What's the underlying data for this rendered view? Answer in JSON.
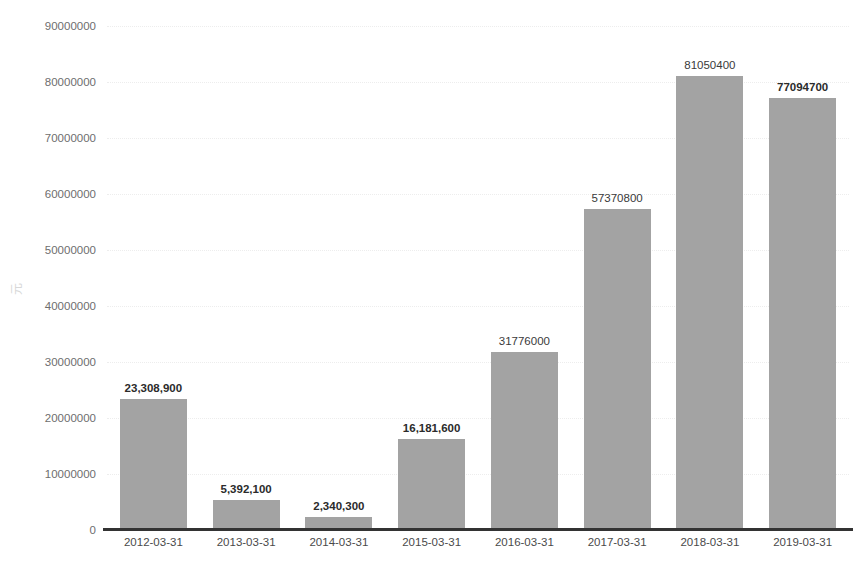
{
  "chart_data": {
    "type": "bar",
    "title": "",
    "xlabel": "",
    "ylabel": "元",
    "categories": [
      "2012-03-31",
      "2013-03-31",
      "2014-03-31",
      "2015-03-31",
      "2016-03-31",
      "2017-03-31",
      "2018-03-31",
      "2019-03-31"
    ],
    "values": [
      23308900,
      5392100,
      2340300,
      16181600,
      31776000,
      57370800,
      81050400,
      77094700
    ],
    "point_labels": [
      "23,308,900",
      "5,392,100",
      "2,340,300",
      "16,181,600",
      "31776000",
      "57370800",
      "81050400",
      "77094700"
    ],
    "point_label_bold": [
      true,
      true,
      true,
      true,
      false,
      false,
      false,
      true
    ],
    "ylim": [
      0,
      90000000
    ],
    "ytick_values": [
      0,
      10000000,
      20000000,
      30000000,
      40000000,
      50000000,
      60000000,
      70000000,
      80000000,
      90000000
    ],
    "ytick_labels": [
      "0",
      "10000000",
      "20000000",
      "30000000",
      "40000000",
      "50000000",
      "60000000",
      "70000000",
      "80000000",
      "90000000"
    ],
    "grid": true,
    "grid_style": "dotted",
    "legend": false,
    "legend_position": "none",
    "bar_color": "#a3a3a3",
    "axis_color": "#333333",
    "grid_color": "#ededed",
    "tick_label_color": "#6e6e6e",
    "value_label_color": "#2b2b2b",
    "background_color": "#ffffff"
  }
}
